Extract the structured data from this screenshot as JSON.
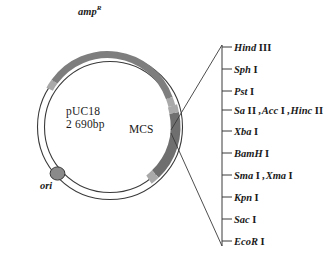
{
  "diagram": {
    "kind": "plasmid-map",
    "plasmid": {
      "name": "pUC18",
      "size": "2 690bp",
      "mcs_label": "MCS",
      "amp_gene": "amp",
      "amp_superscript": "R",
      "ori_label": "ori"
    },
    "colors": {
      "arc_gray": "#7e7e7e",
      "arc_gray_light": "#a9a9a9",
      "mcs_gray": "#6f6f6f",
      "ori_dot": "#8a8a8a",
      "outline": "#3a3a3a",
      "text": "#1a1a1a"
    },
    "restriction_sites": [
      {
        "id": "hindiii",
        "parts": [
          {
            "enzyme": "Hind",
            "numeral": "III"
          }
        ]
      },
      {
        "id": "sphi",
        "parts": [
          {
            "enzyme": "Sph",
            "numeral": "I"
          }
        ]
      },
      {
        "id": "psti",
        "parts": [
          {
            "enzyme": "Pst",
            "numeral": "I"
          }
        ]
      },
      {
        "id": "sali-acci-hincii",
        "parts": [
          {
            "enzyme": "Sa",
            "numeral": "II"
          },
          {
            "enzyme": "Acc",
            "numeral": "I"
          },
          {
            "enzyme": "Hinc",
            "numeral": "II"
          }
        ]
      },
      {
        "id": "xbai",
        "parts": [
          {
            "enzyme": "Xba",
            "numeral": "I"
          }
        ]
      },
      {
        "id": "bamhi",
        "parts": [
          {
            "enzyme": "BamH",
            "numeral": "I"
          }
        ]
      },
      {
        "id": "smai-xmai",
        "parts": [
          {
            "enzyme": "Sma",
            "numeral": "I"
          },
          {
            "enzyme": "Xma",
            "numeral": "I"
          }
        ]
      },
      {
        "id": "kpni",
        "parts": [
          {
            "enzyme": "Kpn",
            "numeral": "I"
          }
        ]
      },
      {
        "id": "saci",
        "parts": [
          {
            "enzyme": "Sac",
            "numeral": "I"
          }
        ]
      },
      {
        "id": "ecori",
        "parts": [
          {
            "enzyme": "EcoR",
            "numeral": "I"
          }
        ]
      }
    ]
  }
}
